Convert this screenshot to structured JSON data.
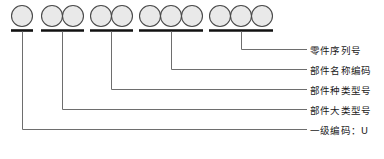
{
  "diagram": {
    "type": "part-number-coding-breakdown",
    "circle_groups": [
      {
        "id": "group-1",
        "circle_count": 1,
        "label_index": 4
      },
      {
        "id": "group-2",
        "circle_count": 2,
        "label_index": 3
      },
      {
        "id": "group-3",
        "circle_count": 2,
        "label_index": 2
      },
      {
        "id": "group-4",
        "circle_count": 3,
        "label_index": 1
      },
      {
        "id": "group-5",
        "circle_count": 3,
        "label_index": 0
      }
    ],
    "total_circles": 11,
    "labels": [
      {
        "id": "label-serial-number",
        "text": "零件序列号"
      },
      {
        "id": "label-component-name-code",
        "text": "部件名称编码"
      },
      {
        "id": "label-component-category-model",
        "text": "部件种类型号"
      },
      {
        "id": "label-component-major-class-model",
        "text": "部件大类型号"
      },
      {
        "id": "label-primary-code",
        "text": "一级编码：U"
      }
    ],
    "colors": {
      "circle_fill": "#e8e8e8",
      "circle_stroke": "#4a4a4a",
      "underline": "#111111",
      "leader_line": "#6e6e6e",
      "text": "#1a1a1a",
      "background": "#ffffff"
    }
  }
}
